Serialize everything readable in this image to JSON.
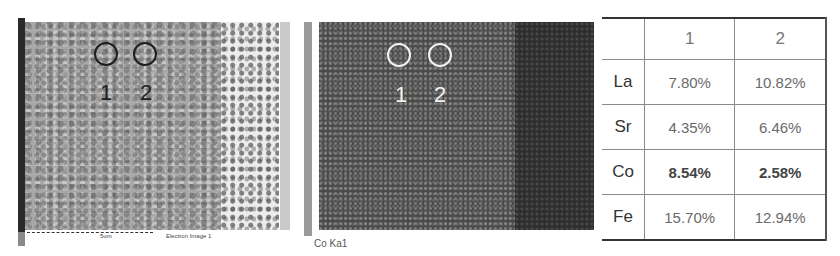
{
  "sem_image": {
    "points": [
      {
        "label": "1"
      },
      {
        "label": "2"
      }
    ],
    "scale_label": "5um",
    "caption": "Electron Image 1"
  },
  "eds_map": {
    "points": [
      {
        "label": "1"
      },
      {
        "label": "2"
      }
    ],
    "caption": "Co Ka1"
  },
  "composition_table": {
    "columns": [
      "",
      "1",
      "2"
    ],
    "rows": [
      {
        "element": "La",
        "p1": "7.80%",
        "p2": "10.82%"
      },
      {
        "element": "Sr",
        "p1": "4.35%",
        "p2": "6.46%"
      },
      {
        "element": "Co",
        "p1": "8.54%",
        "p2": "2.58%"
      },
      {
        "element": "Fe",
        "p1": "15.70%",
        "p2": "12.94%"
      }
    ]
  }
}
